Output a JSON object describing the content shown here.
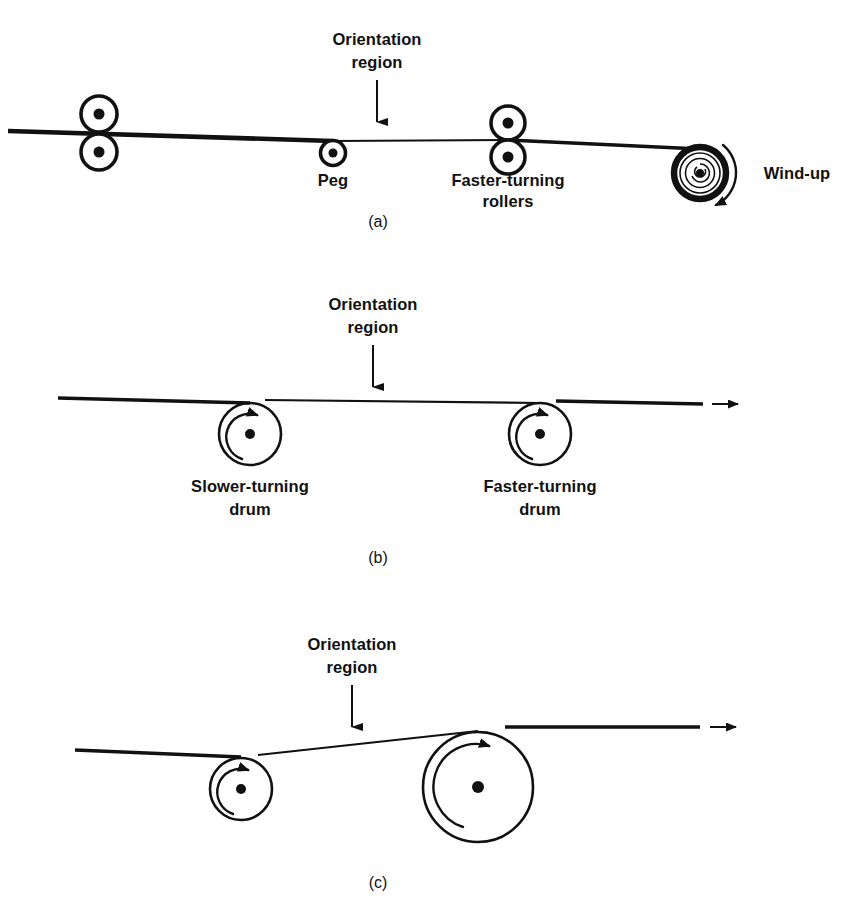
{
  "figure": {
    "panels": [
      {
        "id": "a",
        "caption": "(a)",
        "orientation_label_line1": "Orientation",
        "orientation_label_line2": "region",
        "labels": {
          "peg": "Peg",
          "faster_rollers_line1": "Faster-turning",
          "faster_rollers_line2": "rollers",
          "windup": "Wind-up"
        }
      },
      {
        "id": "b",
        "caption": "(b)",
        "orientation_label_line1": "Orientation",
        "orientation_label_line2": "region",
        "labels": {
          "slower_drum_line1": "Slower-turning",
          "slower_drum_line2": "drum",
          "faster_drum_line1": "Faster-turning",
          "faster_drum_line2": "drum"
        }
      },
      {
        "id": "c",
        "caption": "(c)",
        "orientation_label_line1": "Orientation",
        "orientation_label_line2": "region"
      }
    ]
  },
  "colors": {
    "ink": "#111111",
    "paper": "#ffffff"
  }
}
